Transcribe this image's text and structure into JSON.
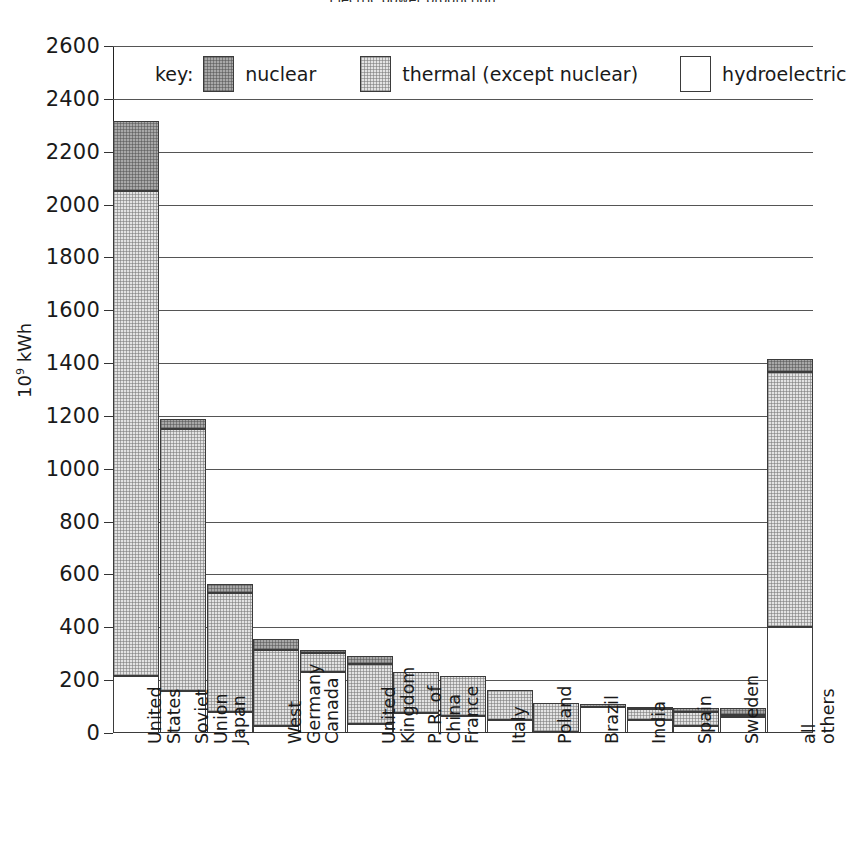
{
  "title": "Electric power production",
  "axis": {
    "ylabel_main": "10",
    "ylabel_sup": "9",
    "ylabel_unit": " kWh",
    "yticks": [
      "0",
      "200",
      "400",
      "600",
      "800",
      "1000",
      "1200",
      "1400",
      "1600",
      "1800",
      "2000",
      "2200",
      "2400",
      "2600"
    ]
  },
  "legend": {
    "key_label": "key:",
    "items": [
      {
        "name": "nuclear",
        "swatch": "nuclear-swatch",
        "color": "#a8a8a8"
      },
      {
        "name": "thermal (except nuclear)",
        "swatch": "thermal-swatch",
        "color": "#e3e3e3"
      },
      {
        "name": "hydroelectric",
        "swatch": "hydro-swatch",
        "color": "#ffffff"
      }
    ]
  },
  "chart_data": {
    "type": "bar",
    "subtype": "stacked-vertical",
    "title": "Electric power production",
    "xlabel": "",
    "ylabel": "10^9 kWh",
    "ylim": [
      0,
      2600
    ],
    "ytick_step": 200,
    "grid": true,
    "legend_position": "top-inside",
    "categories": [
      "United States",
      "Soviet Union",
      "Japan",
      "West Germany",
      "Canada",
      "United Kingdom",
      "P. R. of China",
      "France",
      "Italy",
      "Poland",
      "Brazil",
      "India",
      "Spain",
      "Sweden",
      "all others"
    ],
    "category_lines": [
      [
        "United",
        "States"
      ],
      [
        "Soviet",
        "Union"
      ],
      [
        "Japan"
      ],
      [
        "West",
        "Germany"
      ],
      [
        "Canada"
      ],
      [
        "United",
        "Kingdom"
      ],
      [
        "P. R. of",
        "China"
      ],
      [
        "France"
      ],
      [
        "Italy"
      ],
      [
        "Poland"
      ],
      [
        "Brazil"
      ],
      [
        "India"
      ],
      [
        "Spain"
      ],
      [
        "Sweden"
      ],
      [
        "all",
        "others"
      ]
    ],
    "series": [
      {
        "name": "hydroelectric",
        "color": "#ffffff",
        "values": [
          215,
          160,
          80,
          25,
          230,
          35,
          75,
          64,
          49,
          4,
          100,
          50,
          28,
          60,
          400
        ]
      },
      {
        "name": "thermal (except nuclear)",
        "color": "#e3e3e3",
        "values": [
          1835,
          990,
          450,
          289,
          72,
          225,
          155,
          152,
          114,
          110,
          5,
          42,
          52,
          10,
          967
        ]
      },
      {
        "name": "nuclear",
        "color": "#a8a8a8",
        "values": [
          268,
          40,
          35,
          41,
          12,
          32,
          0,
          0,
          0,
          0,
          0,
          3,
          15,
          25,
          49
        ]
      }
    ],
    "totals": [
      2318,
      1190,
      565,
      355,
      314,
      292,
      230,
      216,
      163,
      114,
      105,
      95,
      95,
      95,
      1416
    ]
  }
}
